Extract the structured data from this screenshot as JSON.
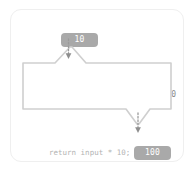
{
  "diagram": {
    "input_badge": {
      "value": "10",
      "icon": "value-badge"
    },
    "output_badge": {
      "value": "100",
      "icon": "value-badge"
    },
    "function_box": {
      "label": "함수",
      "expression": "input x 10"
    },
    "return_statement": "return input * 10;",
    "arrows": [
      {
        "name": "input-arrow",
        "style": "dotted",
        "direction": "down"
      },
      {
        "name": "output-arrow",
        "style": "dotted",
        "direction": "down"
      }
    ],
    "colors": {
      "badge_fill": "#a9a9a9",
      "badge_text": "#ffffff",
      "box_stroke": "#cfcfcf",
      "card_border": "#efefef",
      "label_text": "#6e6e6e",
      "code_text": "#b3b3b3",
      "arrow": "#9a9a9a",
      "background": "#ffffff"
    }
  }
}
